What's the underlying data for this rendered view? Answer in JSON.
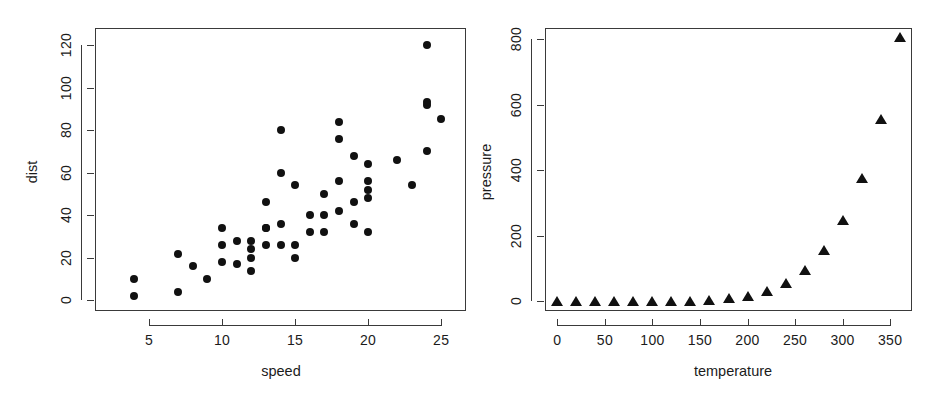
{
  "figure": {
    "background": "#ffffff",
    "point_color": "#111111",
    "axis_color": "#3a3a3a",
    "panel_count": 2
  },
  "chart_data": [
    {
      "type": "scatter",
      "title": "",
      "xlabel": "speed",
      "ylabel": "dist",
      "xlim": [
        1.3,
        26.7
      ],
      "ylim": [
        -5,
        128
      ],
      "xticks": [
        5,
        10,
        15,
        20,
        25
      ],
      "xticklabels": [
        "5",
        "10",
        "15",
        "20",
        "25"
      ],
      "yticks": [
        0,
        20,
        40,
        60,
        80,
        100,
        120
      ],
      "yticklabels": [
        "0",
        "20",
        "40",
        "60",
        "80",
        "100",
        "120"
      ],
      "grid": false,
      "legend": "none",
      "marker": "filled-circle",
      "x": [
        4,
        4,
        7,
        7,
        8,
        9,
        10,
        10,
        10,
        11,
        11,
        12,
        12,
        12,
        12,
        13,
        13,
        13,
        13,
        14,
        14,
        14,
        14,
        15,
        15,
        15,
        16,
        16,
        17,
        17,
        17,
        18,
        18,
        18,
        18,
        19,
        19,
        19,
        20,
        20,
        20,
        20,
        20,
        22,
        23,
        24,
        24,
        24,
        24,
        25
      ],
      "y": [
        2,
        10,
        4,
        22,
        16,
        10,
        18,
        26,
        34,
        17,
        28,
        14,
        20,
        24,
        28,
        26,
        34,
        34,
        46,
        26,
        36,
        60,
        80,
        20,
        26,
        54,
        32,
        40,
        32,
        40,
        50,
        42,
        56,
        76,
        84,
        36,
        46,
        68,
        32,
        48,
        52,
        56,
        64,
        66,
        54,
        70,
        92,
        93,
        120,
        85
      ]
    },
    {
      "type": "scatter",
      "title": "",
      "xlabel": "temperature",
      "ylabel": "pressure",
      "xlim": [
        -13,
        373
      ],
      "ylim": [
        -30,
        835
      ],
      "xticks": [
        0,
        50,
        100,
        150,
        200,
        250,
        300,
        350
      ],
      "xticklabels": [
        "0",
        "50",
        "100",
        "150",
        "200",
        "250",
        "300",
        "350"
      ],
      "yticks": [
        0,
        200,
        400,
        600,
        800
      ],
      "yticklabels": [
        "0",
        "200",
        "400",
        "600",
        "800"
      ],
      "grid": false,
      "legend": "none",
      "marker": "filled-triangle",
      "x": [
        0,
        20,
        40,
        60,
        80,
        100,
        120,
        140,
        160,
        180,
        200,
        220,
        240,
        260,
        280,
        300,
        320,
        340,
        360
      ],
      "y": [
        0.0002,
        0.0012,
        0.006,
        0.03,
        0.09,
        0.27,
        0.75,
        1.85,
        4.2,
        8.8,
        17.3,
        32.1,
        57.0,
        96.0,
        157.0,
        247.0,
        376.0,
        558.0,
        806.0
      ]
    }
  ]
}
